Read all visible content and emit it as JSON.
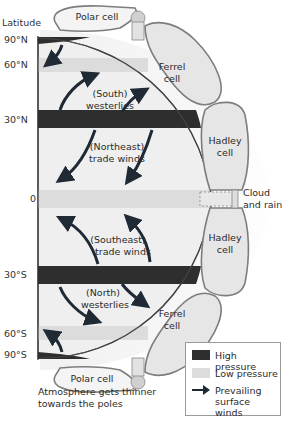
{
  "axis": {
    "title": "Latitude",
    "ticks": [
      {
        "label": "90°N",
        "y": 40
      },
      {
        "label": "60°N",
        "y": 65
      },
      {
        "label": "30°N",
        "y": 120
      },
      {
        "label": "0",
        "y": 199
      },
      {
        "label": "30°S",
        "y": 275
      },
      {
        "label": "60°S",
        "y": 334
      },
      {
        "label": "90°S",
        "y": 355
      }
    ]
  },
  "cells": {
    "polar_north": "Polar cell",
    "ferrel_north_1": "Ferrel",
    "ferrel_north_2": "cell",
    "hadley_north_1": "Hadley",
    "hadley_north_2": "cell",
    "hadley_south_1": "Hadley",
    "hadley_south_2": "cell",
    "ferrel_south_1": "Ferrel",
    "ferrel_south_2": "cell",
    "polar_south": "Polar cell"
  },
  "winds": {
    "nh_westerlies_1": "(South)",
    "nh_westerlies_2": "westerlies",
    "nh_trades_1": "(Northeast)",
    "nh_trades_2": "trade winds",
    "sh_trades_1": "(Southeast)",
    "sh_trades_2": "trade winds",
    "sh_westerlies_1": "(North)",
    "sh_westerlies_2": "westerlies"
  },
  "equator_label": {
    "line1": "Cloud",
    "line2": "and rain"
  },
  "legend": {
    "items": [
      {
        "label": "High pressure",
        "color": "#2e2e2e"
      },
      {
        "label": "Low pressure",
        "color": "#d9d9d9"
      },
      {
        "label_1": "Prevailing",
        "label_2": "surface winds",
        "color": "#1f2a35"
      }
    ]
  },
  "caption": "Atmosphere gets thinner towards the poles",
  "colors": {
    "high_pressure": "#2e2e2e",
    "low_pressure": "#dedede",
    "cell_fill": "#e6e6e6",
    "cell_stroke": "#7d7d7d",
    "arrow": "#1f2a35"
  }
}
